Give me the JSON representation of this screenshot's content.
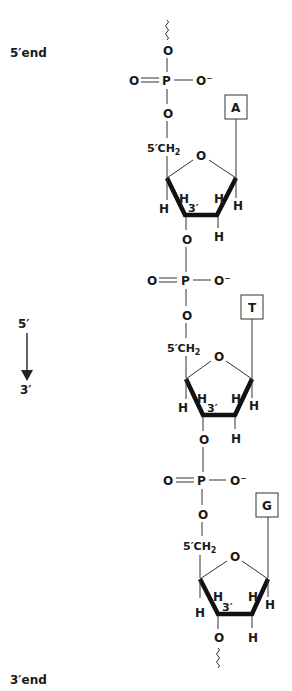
{
  "labels": {
    "five_prime_end": "5′end",
    "three_prime_end": "3′end",
    "direction_top": "5′",
    "direction_bottom": "3′"
  },
  "atoms": {
    "oxygen": "O",
    "phosphorus": "P",
    "oxide": "O⁻",
    "hydrogen": "H",
    "ch2_prefix": "5′CH",
    "ch2_sub": "2",
    "ring_3prime": "3′"
  },
  "nucleotides": [
    {
      "base": "A"
    },
    {
      "base": "T"
    },
    {
      "base": "G"
    }
  ],
  "colors": {
    "ink": "#1a1a1a",
    "background": "#ffffff"
  }
}
